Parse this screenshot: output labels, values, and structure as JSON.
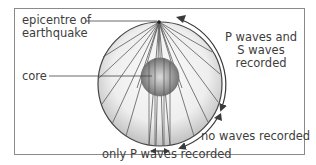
{
  "diagram": {
    "labels": {
      "epicentre": [
        "epicentre of",
        "earthquake"
      ],
      "core": "core",
      "p_and_s": [
        "P waves and",
        "S waves",
        "recorded"
      ],
      "no_waves": "no waves recorded",
      "only_p": "only P waves recorded"
    },
    "colors": {
      "frame": "#8a8a8a",
      "globe_outline": "#444444",
      "globe_fill_light": "#f4f4f4",
      "globe_fill_dark": "#bdbdbd",
      "core_light": "#d9d9d9",
      "core_dark": "#6e6e6e",
      "rays": "#555555",
      "arrows": "#3a3a3a",
      "text": "#3d3d3d"
    }
  }
}
